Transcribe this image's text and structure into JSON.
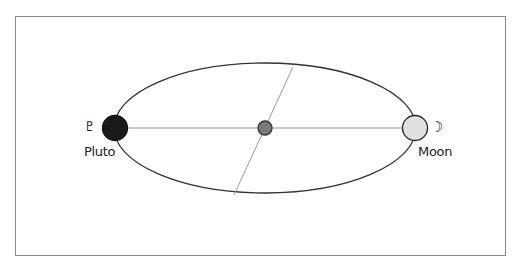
{
  "diagram": {
    "title": "",
    "bodies": {
      "left": {
        "name": "Pluto",
        "symbol": "♇",
        "fill": "#1a1a1a"
      },
      "right": {
        "name": "Moon",
        "symbol": "☽",
        "fill": "#e0e0e0"
      },
      "center": {
        "fill": "#7a7a7a"
      }
    },
    "colors": {
      "stroke": "#333333",
      "line": "#888888",
      "frame": "#8a8a8a"
    }
  }
}
